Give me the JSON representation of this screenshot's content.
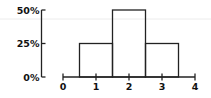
{
  "chart_data": {
    "type": "bar",
    "title": "",
    "xlabel": "",
    "ylabel": "",
    "x_ticks": [
      "0",
      "1",
      "2",
      "3",
      "4"
    ],
    "y_ticks": [
      "0%",
      "25%",
      "50%"
    ],
    "xlim": [
      0,
      4
    ],
    "ylim": [
      0,
      50
    ],
    "bars": [
      {
        "x_start": 0.5,
        "x_end": 1.5,
        "center": 1,
        "value": 25
      },
      {
        "x_start": 1.5,
        "x_end": 2.5,
        "center": 2,
        "value": 50
      },
      {
        "x_start": 2.5,
        "x_end": 3.5,
        "center": 3,
        "value": 25
      }
    ],
    "categories": [
      "1",
      "2",
      "3"
    ],
    "values": [
      25,
      50,
      25
    ],
    "grid": false,
    "legend": null
  }
}
